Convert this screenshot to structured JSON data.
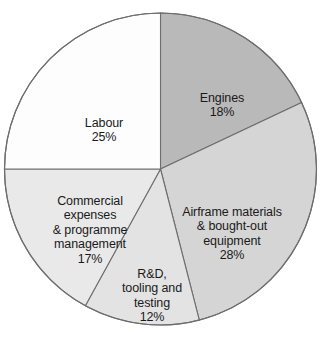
{
  "chart_data": {
    "type": "pie",
    "title": "",
    "subtitle": "",
    "xlabel": "",
    "ylabel": "",
    "grid": false,
    "legend_position": "none",
    "labels_inside_slices": true,
    "start_angle_deg": 0,
    "direction": "clockwise",
    "units": "percent",
    "categories": [
      "Engines",
      "Airframe materials & bought-out equipment",
      "R&D, tooling and testing",
      "Commercial expenses & programme management",
      "Labour"
    ],
    "values": [
      18,
      28,
      12,
      17,
      25
    ],
    "slices": [
      {
        "name": "engines",
        "label_lines": "Engines",
        "percent_text": "18%",
        "value": 18,
        "color": "#b9b9b9",
        "start_pct": 0,
        "end_pct": 18
      },
      {
        "name": "airframe",
        "label_lines": "Airframe materials\n& bought-out\nequipment",
        "percent_text": "28%",
        "value": 28,
        "color": "#d5d5d5",
        "start_pct": 18,
        "end_pct": 46
      },
      {
        "name": "rd-tooling-testing",
        "label_lines": "R&D,\ntooling and\ntesting",
        "percent_text": "12%",
        "value": 12,
        "color": "#e3e3e3",
        "start_pct": 46,
        "end_pct": 58
      },
      {
        "name": "commercial-expenses",
        "label_lines": "Commercial\nexpenses\n& programme\nmanagement",
        "percent_text": "17%",
        "value": 17,
        "color": "#e9e9e9",
        "start_pct": 58,
        "end_pct": 75
      },
      {
        "name": "labour",
        "label_lines": "Labour",
        "percent_text": "25%",
        "value": 25,
        "color": "#fdfdfd",
        "start_pct": 75,
        "end_pct": 100
      }
    ],
    "outline_color": "#6e6e6e",
    "background_color": "#ffffff"
  }
}
